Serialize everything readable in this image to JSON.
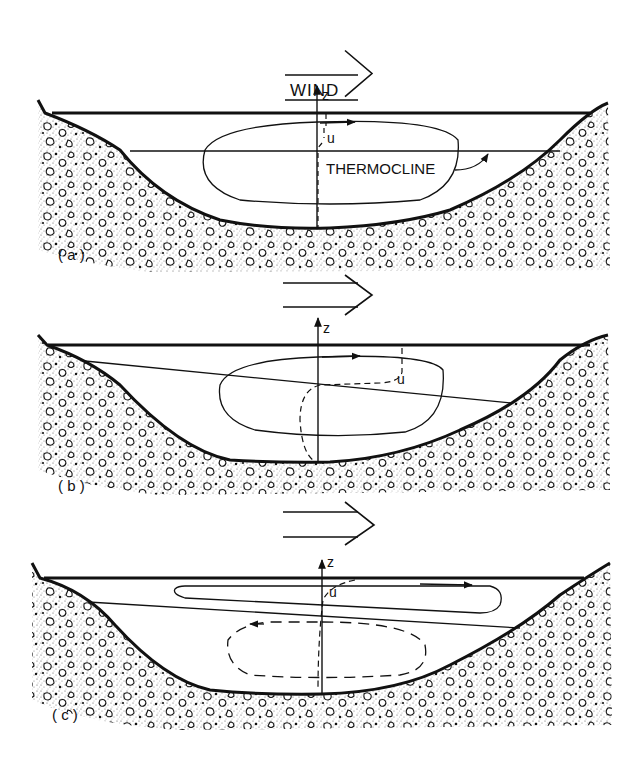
{
  "figure": {
    "wind_label": "WIND",
    "thermocline_label": "THERMOCLINE",
    "axis_label": "z",
    "velocity_label": "u",
    "panels": [
      {
        "id": "a",
        "label": "( a )"
      },
      {
        "id": "b",
        "label": "( b )"
      },
      {
        "id": "c",
        "label": "( c )"
      }
    ]
  },
  "colors": {
    "ink": "#111111",
    "background": "#ffffff",
    "stipple": "#444444"
  }
}
